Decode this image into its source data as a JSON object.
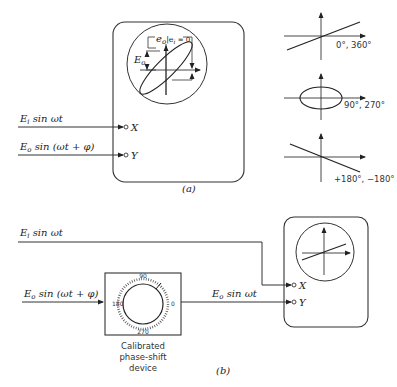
{
  "part_a": {
    "label": "(a)",
    "scope": {
      "annotation_top": "e",
      "annotation_top_sub": "o",
      "annotation_condition": "|e",
      "annotation_condition_sub": "i",
      "annotation_condition_eq": " = 0",
      "annotation_left": "E",
      "annotation_left_sub": "o"
    },
    "inputs": {
      "x_signal": "E",
      "x_signal_sub": "i",
      "x_signal_rest": " sin ωt",
      "y_signal": "E",
      "y_signal_sub": "o",
      "y_signal_rest": " sin (ωt + φ)",
      "x_terminal": "X",
      "y_terminal": "Y"
    },
    "patterns": [
      {
        "shape": "line-positive-slope",
        "label": "0°, 360°"
      },
      {
        "shape": "ellipse",
        "label": "90°, 270°"
      },
      {
        "shape": "line-negative-slope",
        "label": "+180°, −180°"
      }
    ]
  },
  "part_b": {
    "label": "(b)",
    "inputs": {
      "top_signal": "E",
      "top_signal_sub": "i",
      "top_signal_rest": " sin ωt",
      "left_signal": "E",
      "left_signal_sub": "o",
      "left_signal_rest": " sin (ωt + φ)",
      "out_signal": "E",
      "out_signal_sub": "o",
      "out_signal_rest": " sin ωt",
      "x_terminal": "X",
      "y_terminal": "Y"
    },
    "dial": {
      "top": "90",
      "left": "180",
      "right": "0",
      "bottom": "270"
    },
    "device_caption": [
      "Calibrated",
      "phase-shift",
      "device"
    ]
  }
}
